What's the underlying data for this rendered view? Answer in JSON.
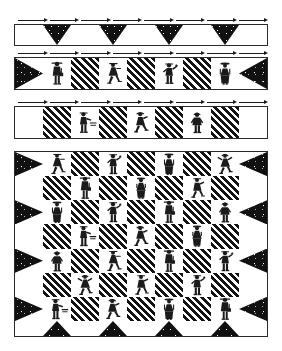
{
  "document": {
    "kind": "quilt-pattern-diagram",
    "title": "Quilt Assembly Diagram",
    "palette": {
      "dark_print": "#111111",
      "stripe_dark": "#141414",
      "background": "#ffffff",
      "outline": "#2b2b2b",
      "arrow": "#1a1a1a"
    }
  },
  "strips": [
    {
      "id": "strip-1",
      "name": "top-border-strip",
      "label": "Top border strip",
      "arrow_count": 8,
      "cells": [
        {
          "type": "plain",
          "name": "plain-square"
        },
        {
          "type": "geese",
          "name": "flying-geese-down"
        },
        {
          "type": "plain",
          "name": "plain-square"
        },
        {
          "type": "geese",
          "name": "flying-geese-down"
        },
        {
          "type": "plain",
          "name": "plain-square"
        },
        {
          "type": "geese",
          "name": "flying-geese-down"
        },
        {
          "type": "plain",
          "name": "plain-square"
        },
        {
          "type": "geese",
          "name": "flying-geese-down"
        },
        {
          "type": "plain",
          "name": "plain-square"
        }
      ]
    },
    {
      "id": "strip-2",
      "name": "figure-strip-upper",
      "label": "Upper figure strip",
      "arrow_count": 8,
      "cells": [
        {
          "type": "tri-left",
          "name": "corner-triangle"
        },
        {
          "type": "figure",
          "name": "figure-block",
          "figure": "man-with-lantern"
        },
        {
          "type": "stripe",
          "name": "striped-square"
        },
        {
          "type": "figure",
          "name": "figure-block",
          "figure": "girl-skating"
        },
        {
          "type": "stripe",
          "name": "striped-square"
        },
        {
          "type": "figure",
          "name": "figure-block",
          "figure": "boy-waving"
        },
        {
          "type": "stripe",
          "name": "striped-square"
        },
        {
          "type": "figure",
          "name": "figure-block",
          "figure": "woman-in-hat"
        },
        {
          "type": "tri-right",
          "name": "corner-triangle"
        }
      ]
    },
    {
      "id": "strip-3",
      "name": "figure-strip-lower",
      "label": "Lower figure strip",
      "arrow_count": 8,
      "cells": [
        {
          "type": "plain",
          "name": "plain-square"
        },
        {
          "type": "stripe",
          "name": "striped-square"
        },
        {
          "type": "figure",
          "name": "figure-block",
          "figure": "boy-with-sled"
        },
        {
          "type": "stripe",
          "name": "striped-square"
        },
        {
          "type": "figure",
          "name": "figure-block",
          "figure": "girl-running"
        },
        {
          "type": "stripe",
          "name": "striped-square"
        },
        {
          "type": "figure",
          "name": "figure-block",
          "figure": "child-in-coat"
        },
        {
          "type": "stripe",
          "name": "striped-square"
        },
        {
          "type": "plain",
          "name": "plain-square"
        }
      ]
    }
  ],
  "quilt": {
    "id": "quilt-body",
    "name": "main-quilt-body",
    "label": "Main quilt body",
    "columns": 7,
    "rows": 8,
    "grid": [
      [
        {
          "type": "tri-left",
          "name": "edge-triangle"
        },
        {
          "type": "figure",
          "name": "figure-block",
          "figure": "girl-skating"
        },
        {
          "type": "stripe",
          "name": "striped-square"
        },
        {
          "type": "figure",
          "name": "figure-block",
          "figure": "boy-waving"
        },
        {
          "type": "stripe",
          "name": "striped-square"
        },
        {
          "type": "figure",
          "name": "figure-block",
          "figure": "woman-in-hat"
        },
        {
          "type": "stripe",
          "name": "striped-square"
        },
        {
          "type": "figure",
          "name": "figure-block",
          "figure": "girl-dancing"
        },
        {
          "type": "tri-right",
          "name": "edge-triangle"
        }
      ],
      [
        {
          "type": "plain",
          "name": "plain-square"
        },
        {
          "type": "stripe",
          "name": "striped-square"
        },
        {
          "type": "figure",
          "name": "figure-block",
          "figure": "man-with-lantern"
        },
        {
          "type": "stripe",
          "name": "striped-square"
        },
        {
          "type": "figure",
          "name": "figure-block",
          "figure": "girl-with-muff"
        },
        {
          "type": "stripe",
          "name": "striped-square"
        },
        {
          "type": "figure",
          "name": "figure-block",
          "figure": "boy-skating"
        },
        {
          "type": "stripe",
          "name": "striped-square"
        },
        {
          "type": "plain",
          "name": "plain-square"
        }
      ],
      [
        {
          "type": "tri-left",
          "name": "edge-triangle"
        },
        {
          "type": "figure",
          "name": "figure-block",
          "figure": "woman-in-hat"
        },
        {
          "type": "stripe",
          "name": "striped-square"
        },
        {
          "type": "figure",
          "name": "figure-block",
          "figure": "boy-waving"
        },
        {
          "type": "stripe",
          "name": "striped-square"
        },
        {
          "type": "figure",
          "name": "figure-block",
          "figure": "man-with-lantern"
        },
        {
          "type": "stripe",
          "name": "striped-square"
        },
        {
          "type": "figure",
          "name": "figure-block",
          "figure": "child-in-coat"
        },
        {
          "type": "tri-right",
          "name": "edge-triangle"
        }
      ],
      [
        {
          "type": "plain",
          "name": "plain-square"
        },
        {
          "type": "stripe",
          "name": "striped-square"
        },
        {
          "type": "figure",
          "name": "figure-block",
          "figure": "boy-with-sled"
        },
        {
          "type": "stripe",
          "name": "striped-square"
        },
        {
          "type": "figure",
          "name": "figure-block",
          "figure": "girl-running"
        },
        {
          "type": "stripe",
          "name": "striped-square"
        },
        {
          "type": "figure",
          "name": "figure-block",
          "figure": "girl-with-muff"
        },
        {
          "type": "stripe",
          "name": "striped-square"
        },
        {
          "type": "plain",
          "name": "plain-square"
        }
      ],
      [
        {
          "type": "tri-left",
          "name": "edge-triangle"
        },
        {
          "type": "figure",
          "name": "figure-block",
          "figure": "child-in-coat"
        },
        {
          "type": "stripe",
          "name": "striped-square"
        },
        {
          "type": "figure",
          "name": "figure-block",
          "figure": "girl-skating"
        },
        {
          "type": "stripe",
          "name": "striped-square"
        },
        {
          "type": "figure",
          "name": "figure-block",
          "figure": "man-with-lantern"
        },
        {
          "type": "stripe",
          "name": "striped-square"
        },
        {
          "type": "figure",
          "name": "figure-block",
          "figure": "boy-waving"
        },
        {
          "type": "tri-right",
          "name": "edge-triangle"
        }
      ],
      [
        {
          "type": "plain",
          "name": "plain-square"
        },
        {
          "type": "stripe",
          "name": "striped-square"
        },
        {
          "type": "figure",
          "name": "figure-block",
          "figure": "girl-dancing"
        },
        {
          "type": "stripe",
          "name": "striped-square"
        },
        {
          "type": "figure",
          "name": "figure-block",
          "figure": "boy-skating"
        },
        {
          "type": "stripe",
          "name": "striped-square"
        },
        {
          "type": "figure",
          "name": "figure-block",
          "figure": "boy-waving"
        },
        {
          "type": "stripe",
          "name": "striped-square"
        },
        {
          "type": "plain",
          "name": "plain-square"
        }
      ],
      [
        {
          "type": "tri-left",
          "name": "edge-triangle"
        },
        {
          "type": "figure",
          "name": "figure-block",
          "figure": "boy-with-sled"
        },
        {
          "type": "stripe",
          "name": "striped-square"
        },
        {
          "type": "figure",
          "name": "figure-block",
          "figure": "girl-running"
        },
        {
          "type": "stripe",
          "name": "striped-square"
        },
        {
          "type": "figure",
          "name": "figure-block",
          "figure": "woman-in-hat"
        },
        {
          "type": "stripe",
          "name": "striped-square"
        },
        {
          "type": "figure",
          "name": "figure-block",
          "figure": "man-with-lantern"
        },
        {
          "type": "tri-right",
          "name": "edge-triangle"
        }
      ],
      [
        {
          "type": "plain",
          "name": "plain-square"
        },
        {
          "type": "geese-up",
          "name": "flying-geese-up"
        },
        {
          "type": "plain",
          "name": "plain-square"
        },
        {
          "type": "geese-up",
          "name": "flying-geese-up"
        },
        {
          "type": "plain",
          "name": "plain-square"
        },
        {
          "type": "geese-up",
          "name": "flying-geese-up"
        },
        {
          "type": "plain",
          "name": "plain-square"
        },
        {
          "type": "geese-up",
          "name": "flying-geese-up"
        },
        {
          "type": "plain",
          "name": "plain-square"
        }
      ]
    ]
  }
}
